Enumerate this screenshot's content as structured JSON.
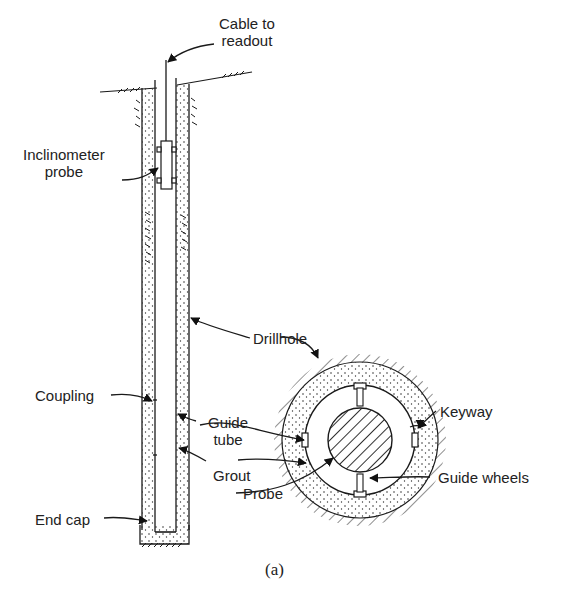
{
  "figure": {
    "caption": "(a)",
    "colors": {
      "line": "#1a1a1a",
      "background": "#ffffff",
      "dots": "#333333"
    }
  },
  "labels": {
    "cable_line1": "Cable to",
    "cable_line2": "readout",
    "incl_line1": "Inclinometer",
    "incl_line2": "probe",
    "drillhole": "Drillhole",
    "coupling": "Coupling",
    "guide_line1": "Guide",
    "guide_line2": "tube",
    "keyway": "Keyway",
    "grout": "Grout",
    "guide_wheels": "Guide wheels",
    "probe": "Probe",
    "end_cap": "End cap"
  }
}
